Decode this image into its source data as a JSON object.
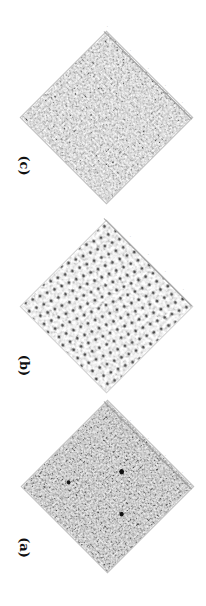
{
  "figure": {
    "orientation": "rotated 90 degrees clockwise",
    "panels": [
      {
        "id": "c",
        "label": "(c)",
        "description": "Grayscale noisy texture, fine-grained, medium gray with scattered bright spots",
        "texture": "fine-gray"
      },
      {
        "id": "b",
        "label": "(b)",
        "description": "Sparse texture on light background with many dark dots arranged in quasi-regular pattern",
        "texture": "sparse-dots"
      },
      {
        "id": "a",
        "label": "(a)",
        "description": "Dense dark-gray noisy texture with occasional dark blobs",
        "texture": "dense-dark"
      }
    ],
    "tick_marks_per_panel": 4
  }
}
